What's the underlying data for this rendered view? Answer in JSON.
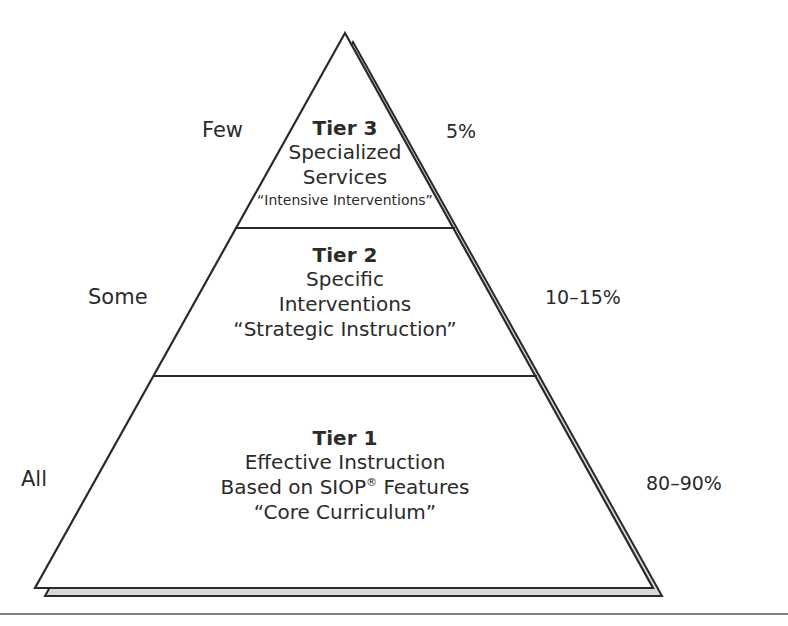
{
  "diagram": {
    "type": "pyramid",
    "tiers": [
      {
        "title": "Tier 3",
        "lines": [
          "Specialized",
          "Services"
        ],
        "small": "“Intensive Interventions”",
        "left_label": "Few",
        "right_label": "5%"
      },
      {
        "title": "Tier 2",
        "lines": [
          "Specific",
          "Interventions",
          "“Strategic Instruction”"
        ],
        "left_label": "Some",
        "right_label": "10–15%"
      },
      {
        "title": "Tier 1",
        "lines": [
          "Effective Instruction",
          "Based on SIOP",
          "“Core Curriculum”"
        ],
        "sup": "®",
        "line2_tail": " Features",
        "left_label": "All",
        "right_label": "80–90%"
      }
    ],
    "colors": {
      "stroke": "#2a2a2a",
      "shadow_fill": "#d8d8d8"
    }
  }
}
